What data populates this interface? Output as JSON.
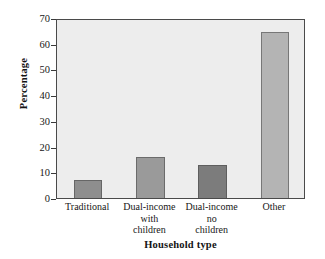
{
  "chart_data": {
    "type": "bar",
    "title": "",
    "subtitle": "",
    "xlabel": "Household type",
    "ylabel": "Percentage",
    "categories": [
      "Traditional",
      "Dual-income with children",
      "Dual-income no children",
      "Other"
    ],
    "category_lines": [
      [
        "Traditional"
      ],
      [
        "Dual-income",
        "with",
        "children"
      ],
      [
        "Dual-income",
        "no",
        "children"
      ],
      [
        "Other"
      ]
    ],
    "values": [
      7,
      16,
      13,
      64.5
    ],
    "ylim": [
      0,
      70
    ],
    "yticks": [
      0,
      10,
      20,
      30,
      40,
      50,
      60,
      70
    ],
    "ytick_labels": [
      "0",
      "10",
      "20",
      "30",
      "40",
      "50",
      "60",
      "70"
    ],
    "grid": false,
    "legend": false,
    "bar_colors": [
      "#8e8e8e",
      "#9a9a9a",
      "#7c7c7c",
      "#b4b4b4"
    ],
    "plot_background": "#ededed",
    "axis_color": "#4a4a4a",
    "figure_background": "#ffffff"
  }
}
